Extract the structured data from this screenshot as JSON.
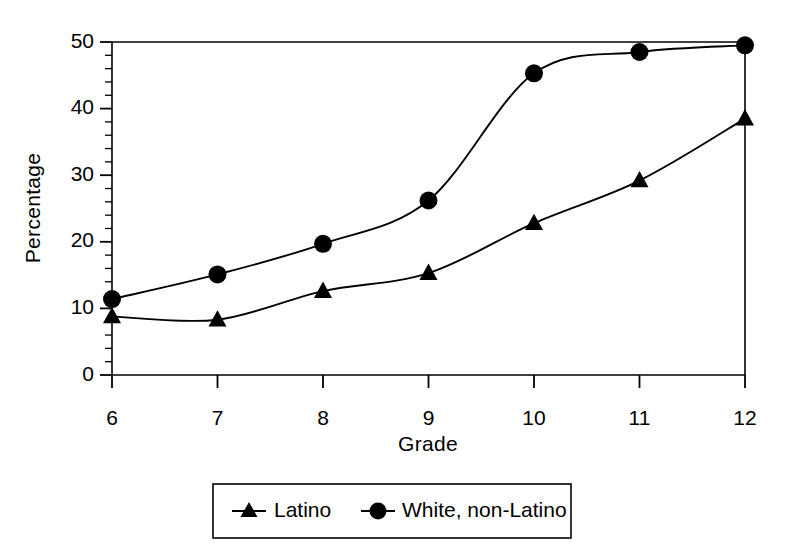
{
  "chart_data": {
    "type": "line",
    "title": "",
    "subtitle": "",
    "xlabel": "Grade",
    "ylabel": "Percentage",
    "x": [
      6,
      7,
      8,
      9,
      10,
      11,
      12
    ],
    "categories": [
      "6",
      "7",
      "8",
      "9",
      "10",
      "11",
      "12"
    ],
    "xlim": [
      6,
      12
    ],
    "ylim": [
      0,
      50
    ],
    "x_ticks": [
      "6",
      "7",
      "8",
      "9",
      "10",
      "11",
      "12"
    ],
    "y_ticks": [
      "0",
      "10",
      "20",
      "30",
      "40",
      "50"
    ],
    "y_minor_tick_step": 2,
    "grid": false,
    "legend_position": "bottom-outside",
    "series": [
      {
        "name": "Latino",
        "marker": "triangle",
        "color": "#000000",
        "values": [
          8.8,
          8.3,
          12.6,
          15.3,
          22.8,
          29.2,
          38.5
        ]
      },
      {
        "name": "White, non-Latino",
        "marker": "circle",
        "color": "#000000",
        "values": [
          11.4,
          15.1,
          19.7,
          26.2,
          45.3,
          48.5,
          49.5
        ]
      }
    ],
    "annotations": []
  },
  "axes": {
    "y_label": "Percentage",
    "x_label": "Grade",
    "y_tick_labels": [
      "50",
      "40",
      "30",
      "20",
      "10",
      "0"
    ],
    "x_tick_labels": [
      "6",
      "7",
      "8",
      "9",
      "10",
      "11",
      "12"
    ]
  },
  "legend": {
    "entries": [
      {
        "label": "Latino",
        "marker": "triangle-marker-icon"
      },
      {
        "label": "White, non-Latino",
        "marker": "circle-marker-icon"
      }
    ]
  },
  "colors": {
    "ink": "#000000",
    "background": "#ffffff"
  }
}
